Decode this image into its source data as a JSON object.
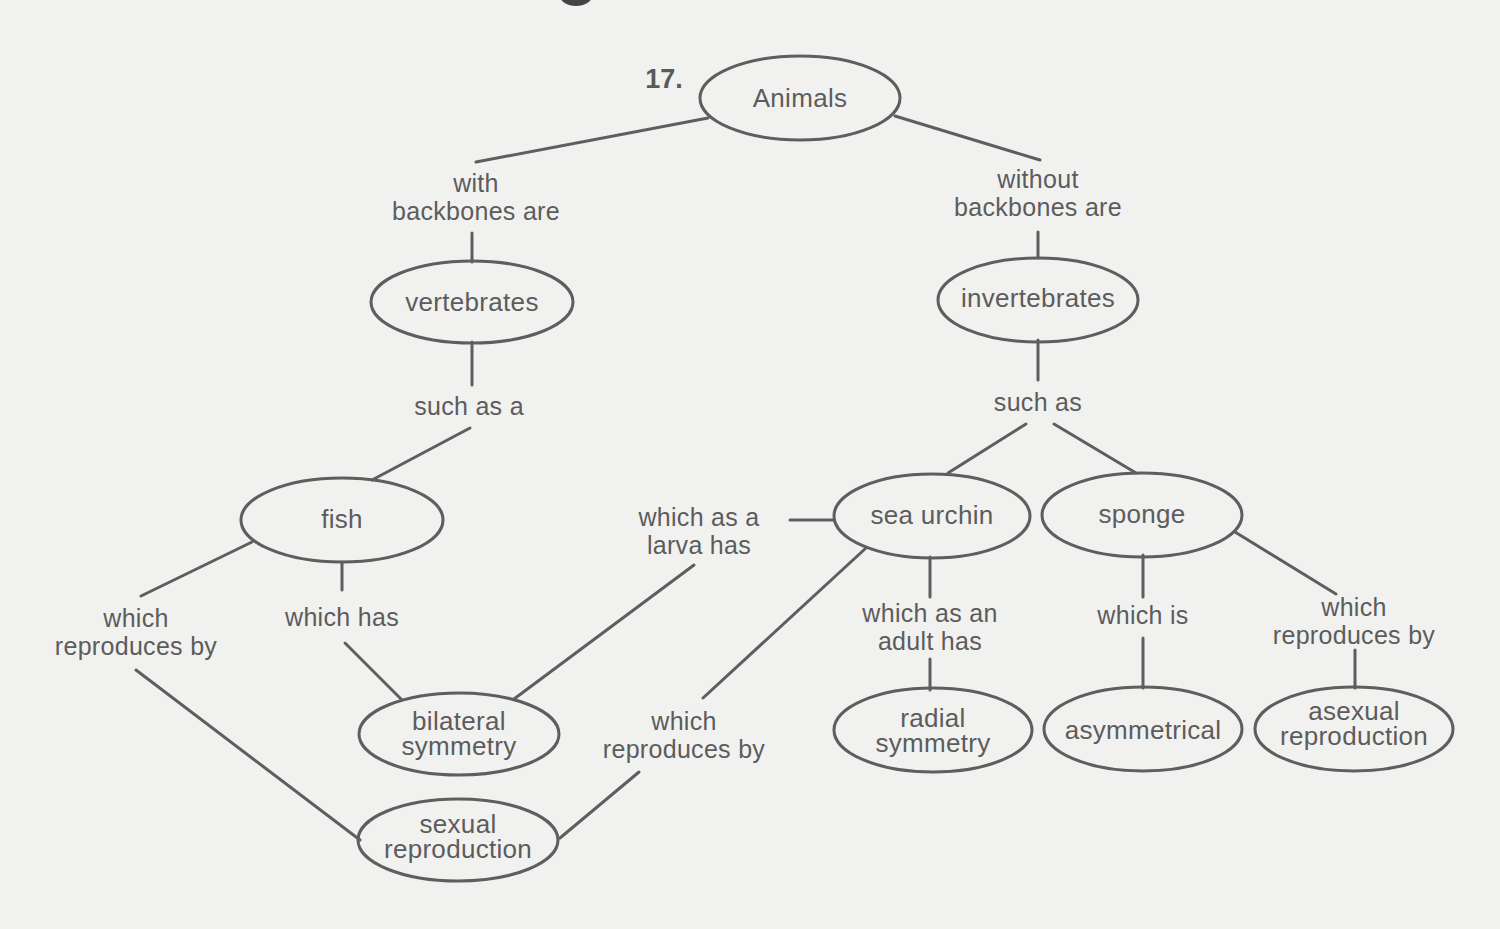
{
  "diagram": {
    "type": "concept-map",
    "question_number": "17.",
    "colors": {
      "background": "#f1f1f0",
      "stroke": "#5e5e5e",
      "text": "#5c5c5c"
    },
    "nodes": {
      "animals": "Animals",
      "vertebrates": "vertebrates",
      "invertebrates": "invertebrates",
      "fish": "fish",
      "sea_urchin": "sea urchin",
      "sponge": "sponge",
      "bilateral_symmetry": "bilateral\nsymmetry",
      "sexual_reproduction": "sexual\nreproduction",
      "radial_symmetry": "radial\nsymmetry",
      "asymmetrical": "asymmetrical",
      "asexual_reproduction": "asexual\nreproduction"
    },
    "links": {
      "with_backbones": "with\nbackbones are",
      "without_backbones": "without\nbackbones are",
      "such_as_a": "such as a",
      "such_as": "such as",
      "fish_reproduces": "which\nreproduces by",
      "fish_has": "which has",
      "larva_has": "which as a\nlarva has",
      "urchin_reproduces": "which\nreproduces by",
      "adult_has": "which as an\nadult has",
      "which_is": "which is",
      "sponge_reproduces": "which\nreproduces by"
    }
  }
}
